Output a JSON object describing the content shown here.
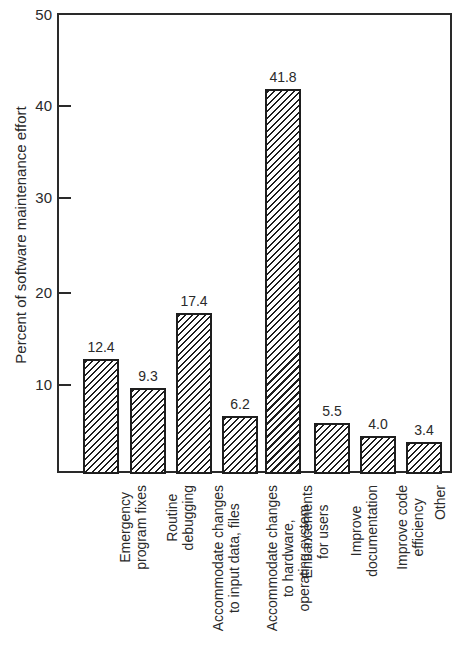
{
  "chart_data": {
    "type": "bar",
    "title": "",
    "xlabel": "",
    "ylabel": "Percent of software maintenance effort",
    "ylim": [
      0,
      50
    ],
    "yticks": [
      10,
      20,
      30,
      40,
      50
    ],
    "grid": false,
    "legend": null,
    "pattern": "diagonal hatch",
    "categories": [
      "Emergency program fixes",
      "Routine debugging",
      "Accommodate changes to input data, files",
      "Accommodate changes to hardware, operating system",
      "Enhancements for users",
      "Improve documentation",
      "Improve code efficiency",
      "Other"
    ],
    "category_lines": [
      [
        "Emergency",
        "program fixes"
      ],
      [
        "Routine",
        "debugging"
      ],
      [
        "Accommodate changes",
        "to input data, files"
      ],
      [
        "Accommodate changes",
        "to hardware,",
        "operating system"
      ],
      [
        "Enhancements",
        "for users"
      ],
      [
        "Improve",
        "documentation"
      ],
      [
        "Improve code",
        "efficiency"
      ],
      [
        "Other"
      ]
    ],
    "values": [
      12.4,
      9.3,
      17.4,
      6.2,
      41.8,
      5.5,
      4.0,
      3.4
    ],
    "value_labels": [
      "12.4",
      "9.3",
      "17.4",
      "6.2",
      "41.8",
      "5.5",
      "4.0",
      "3.4"
    ]
  },
  "axis": {
    "tick_labels": [
      "10",
      "20",
      "30",
      "40",
      "50"
    ]
  },
  "colors": {
    "ink": "#1e1e1e",
    "background": "#ffffff"
  }
}
